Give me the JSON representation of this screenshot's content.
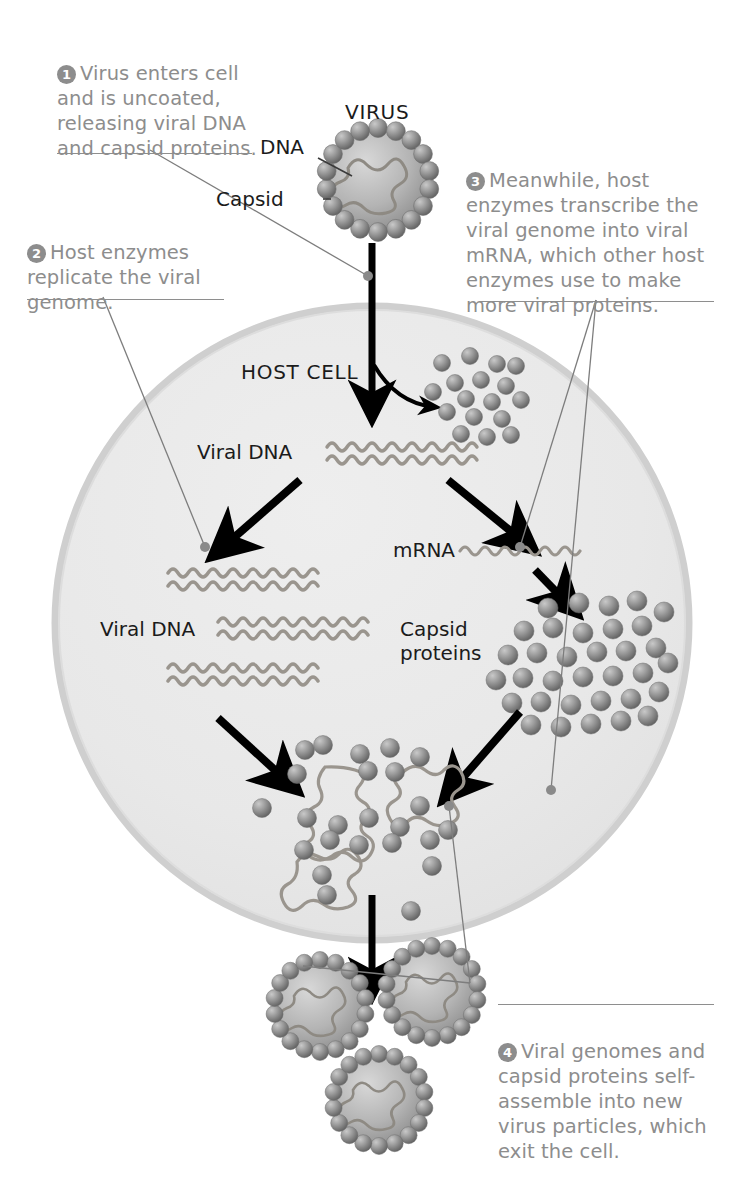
{
  "figure": {
    "colors": {
      "caption_text": "#8d8d8d",
      "label_text": "#1b1b1b",
      "cell_fill": "#e9e9e9",
      "cell_border": "#cfcfcf",
      "protein": "#8b8b8b",
      "nucleic_acid": "#9a958e",
      "arrow": "#000000",
      "leader": "#7d7d7d"
    }
  },
  "captions": [
    {
      "number": "1",
      "text": "Virus enters cell and is uncoated, releasing viral DNA and capsid proteins.",
      "name": "caption-step-1"
    },
    {
      "number": "2",
      "text": "Host enzymes replicate the viral genome.",
      "name": "caption-step-2"
    },
    {
      "number": "3",
      "text": "Meanwhile, host enzymes transcribe the viral genome into viral mRNA, which other host enzymes use to make more viral proteins.",
      "name": "caption-step-3"
    },
    {
      "number": "4",
      "text": "Viral genomes and capsid proteins self-assemble into new virus particles, which exit the cell.",
      "name": "caption-step-4"
    }
  ],
  "labels": {
    "virus": "VIRUS",
    "dna": "DNA",
    "capsid": "Capsid",
    "host_cell": "HOST CELL",
    "viral_dna_top": "Viral DNA",
    "viral_dna_left": "Viral DNA",
    "mrna": "mRNA",
    "capsid_proteins": "Capsid\nproteins"
  }
}
